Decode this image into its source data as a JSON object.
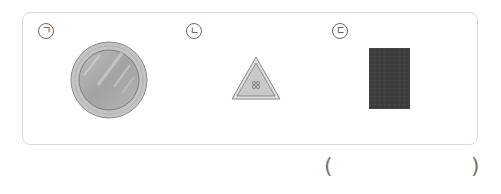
{
  "question": {
    "items": [
      {
        "label": "ㄱ",
        "object": "lens-circle",
        "description": "round glass lens in metal ring"
      },
      {
        "label": "ㄴ",
        "object": "triangle-sign",
        "description": "gray triangle with small symbol"
      },
      {
        "label": "ㄷ",
        "object": "dark-rectangle",
        "description": "dark gray rectangular panel"
      }
    ],
    "answer_open": "(",
    "answer_close": ")",
    "answer_value": ""
  },
  "colors": {
    "border": "#d9d9d9",
    "lens_ring": "#b0b0b0",
    "lens_fill": "#a8a8a8",
    "triangle_fill": "#c8c8c8",
    "rect_fill": "#3b3b3b"
  }
}
